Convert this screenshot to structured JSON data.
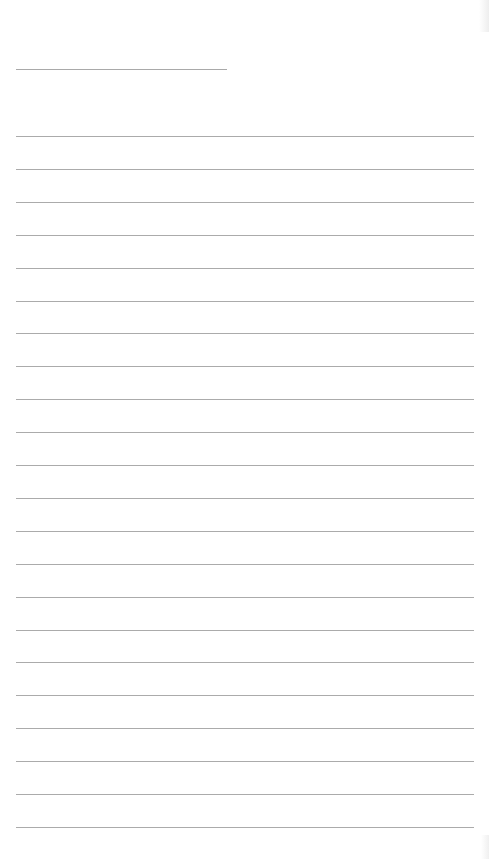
{
  "document": {
    "type": "lined-paper",
    "title_line": {
      "x": 16,
      "y": 69,
      "width": 211
    },
    "rules": {
      "count": 22,
      "start_y": 136,
      "spacing": 32.9,
      "x": 16,
      "width": 458
    },
    "colors": {
      "background": "#ffffff",
      "rule": "#ababab"
    }
  }
}
